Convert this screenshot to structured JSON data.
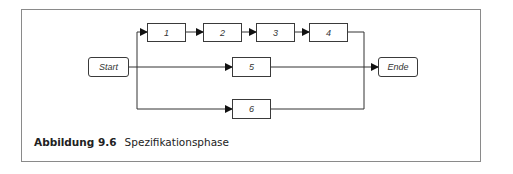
{
  "diagram": {
    "nodes": {
      "start": "Start",
      "n1": "1",
      "n2": "2",
      "n3": "3",
      "n4": "4",
      "n5": "5",
      "n6": "6",
      "end": "Ende"
    },
    "edges": [
      [
        "Start",
        "1"
      ],
      [
        "1",
        "2"
      ],
      [
        "2",
        "3"
      ],
      [
        "3",
        "4"
      ],
      [
        "4",
        "Ende"
      ],
      [
        "Start",
        "5"
      ],
      [
        "5",
        "Ende"
      ],
      [
        "Start",
        "6"
      ],
      [
        "6",
        "Ende"
      ]
    ]
  },
  "caption": {
    "number": "Abbildung 9.6",
    "text": "Spezifikationsphase"
  }
}
